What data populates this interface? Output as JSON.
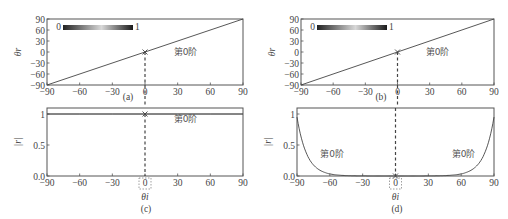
{
  "colors": {
    "axis": "#555555",
    "curve": "#444444",
    "text": "#444444",
    "background": "#ffffff"
  },
  "colorbar": {
    "min_label": "0",
    "max_label": "1"
  },
  "order_label": "第0阶",
  "xlabel_bottom": "θi",
  "ylabel_top": "θr",
  "ylabel_bottom": "|r|",
  "chart_data": [
    {
      "panel": "(a)",
      "type": "line",
      "xlabel": "",
      "ylabel": "θr",
      "xlim": [
        -90,
        90
      ],
      "ylim": [
        -90,
        90
      ],
      "xticks": [
        -90,
        -60,
        -30,
        0,
        30,
        60,
        90
      ],
      "yticks": [
        -90,
        -60,
        -30,
        0,
        30,
        60,
        90
      ],
      "series": [
        {
          "name": "第0阶",
          "x": [
            -90,
            90
          ],
          "y": [
            -90,
            90
          ]
        }
      ],
      "annotations": [
        {
          "text": "第0阶",
          "x": 30,
          "y": 0
        },
        {
          "marker": "x",
          "x": 0,
          "y": 0
        }
      ],
      "vline": 0,
      "colorbar": {
        "range": [
          0,
          1
        ],
        "colormap": "gray"
      }
    },
    {
      "panel": "(b)",
      "type": "line",
      "xlabel": "",
      "ylabel": "θr",
      "xlim": [
        -90,
        90
      ],
      "ylim": [
        -90,
        90
      ],
      "xticks": [
        -90,
        -60,
        -30,
        0,
        30,
        60,
        90
      ],
      "yticks": [
        -90,
        -60,
        -30,
        0,
        30,
        60,
        90
      ],
      "series": [
        {
          "name": "第0阶",
          "x": [
            -90,
            90
          ],
          "y": [
            -90,
            90
          ]
        }
      ],
      "annotations": [
        {
          "text": "第0阶",
          "x": 30,
          "y": 0
        },
        {
          "marker": "x",
          "x": 0,
          "y": 0
        }
      ],
      "vline": 0,
      "colorbar": {
        "range": [
          0,
          1
        ],
        "colormap": "gray"
      }
    },
    {
      "panel": "(c)",
      "type": "line",
      "xlabel": "θi",
      "ylabel": "|r|",
      "xlim": [
        -90,
        90
      ],
      "ylim": [
        0,
        1.05
      ],
      "xticks": [
        -90,
        -60,
        -30,
        0,
        30,
        60,
        90
      ],
      "yticks": [
        0.0,
        0.5,
        1
      ],
      "series": [
        {
          "name": "第0阶",
          "x": [
            -90,
            -60,
            -30,
            0,
            30,
            60,
            90
          ],
          "y": [
            1,
            1,
            1,
            1,
            1,
            1,
            1
          ]
        }
      ],
      "annotations": [
        {
          "text": "第0阶",
          "x": 30,
          "y": 0.92
        },
        {
          "marker": "x",
          "x": 0,
          "y": 1
        }
      ],
      "vline": 0
    },
    {
      "panel": "(d)",
      "type": "line",
      "xlabel": "θi",
      "ylabel": "|r|",
      "xlim": [
        -90,
        90
      ],
      "ylim": [
        0,
        1.05
      ],
      "xticks": [
        -90,
        -60,
        -30,
        0,
        30,
        60,
        90
      ],
      "yticks": [
        0.0,
        0.5,
        1
      ],
      "series": [
        {
          "name": "第0阶",
          "x": [
            -90,
            -87,
            -84,
            -80,
            -75,
            -70,
            -65,
            -60,
            -50,
            -40,
            0,
            40,
            50,
            60,
            65,
            70,
            75,
            80,
            84,
            87,
            90
          ],
          "y": [
            0.95,
            0.72,
            0.55,
            0.38,
            0.22,
            0.12,
            0.06,
            0.03,
            0.01,
            0.0,
            0.0,
            0.0,
            0.01,
            0.03,
            0.06,
            0.12,
            0.22,
            0.38,
            0.55,
            0.72,
            0.95
          ]
        }
      ],
      "annotations": [
        {
          "text": "第0阶",
          "x": -65,
          "y": 0.35
        },
        {
          "text": "第0阶",
          "x": 55,
          "y": 0.35
        },
        {
          "marker": "x",
          "x": 0,
          "y": 0
        }
      ],
      "vline": 0
    }
  ],
  "panels": {
    "a": {
      "label": "(a)"
    },
    "b": {
      "label": "(b)"
    },
    "c": {
      "label": "(c)"
    },
    "d": {
      "label": "(d)"
    }
  }
}
